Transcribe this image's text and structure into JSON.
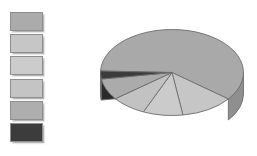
{
  "chart_data": {
    "type": "pie",
    "title": "",
    "subtitle": "",
    "xlabel": "",
    "ylabel": "",
    "three_d": true,
    "grid": false,
    "legend_position": "left",
    "categories": [
      "Series 1",
      "Series 2",
      "Series 3",
      "Series 4",
      "Series 5",
      "Series 6"
    ],
    "values": [
      60,
      12,
      9,
      8,
      8,
      3
    ],
    "colors": [
      "#a9a9a9",
      "#c6c6c6",
      "#cbcbcb",
      "#c2c2c2",
      "#ababab",
      "#3c3c3c"
    ],
    "slices": [
      {
        "label": "Series 1",
        "value": 60,
        "color": "#a9a9a9",
        "side_color": "#8f8f8f"
      },
      {
        "label": "Series 2",
        "value": 12,
        "color": "#c6c6c6",
        "side_color": "#a8a8a8"
      },
      {
        "label": "Series 3",
        "value": 9,
        "color": "#cbcbcb",
        "side_color": "#adadad"
      },
      {
        "label": "Series 4",
        "value": 8,
        "color": "#c2c2c2",
        "side_color": "#a4a4a4"
      },
      {
        "label": "Series 5",
        "value": 8,
        "color": "#ababab",
        "side_color": "#909090"
      },
      {
        "label": "Series 6",
        "value": 3,
        "color": "#3c3c3c",
        "side_color": "#2a2a2a"
      }
    ]
  },
  "legend": {
    "items": [
      {
        "label": "Series 1",
        "color": "#ababab"
      },
      {
        "label": "Series 2",
        "color": "#c6c6c6"
      },
      {
        "label": "Series 3",
        "color": "#cccccc"
      },
      {
        "label": "Series 4",
        "color": "#c4c4c4"
      },
      {
        "label": "Series 5",
        "color": "#aeaeae"
      },
      {
        "label": "Series 6",
        "color": "#3c3c3c"
      }
    ]
  },
  "canvas": {
    "background": "#ffffff",
    "width": 257,
    "height": 156
  }
}
